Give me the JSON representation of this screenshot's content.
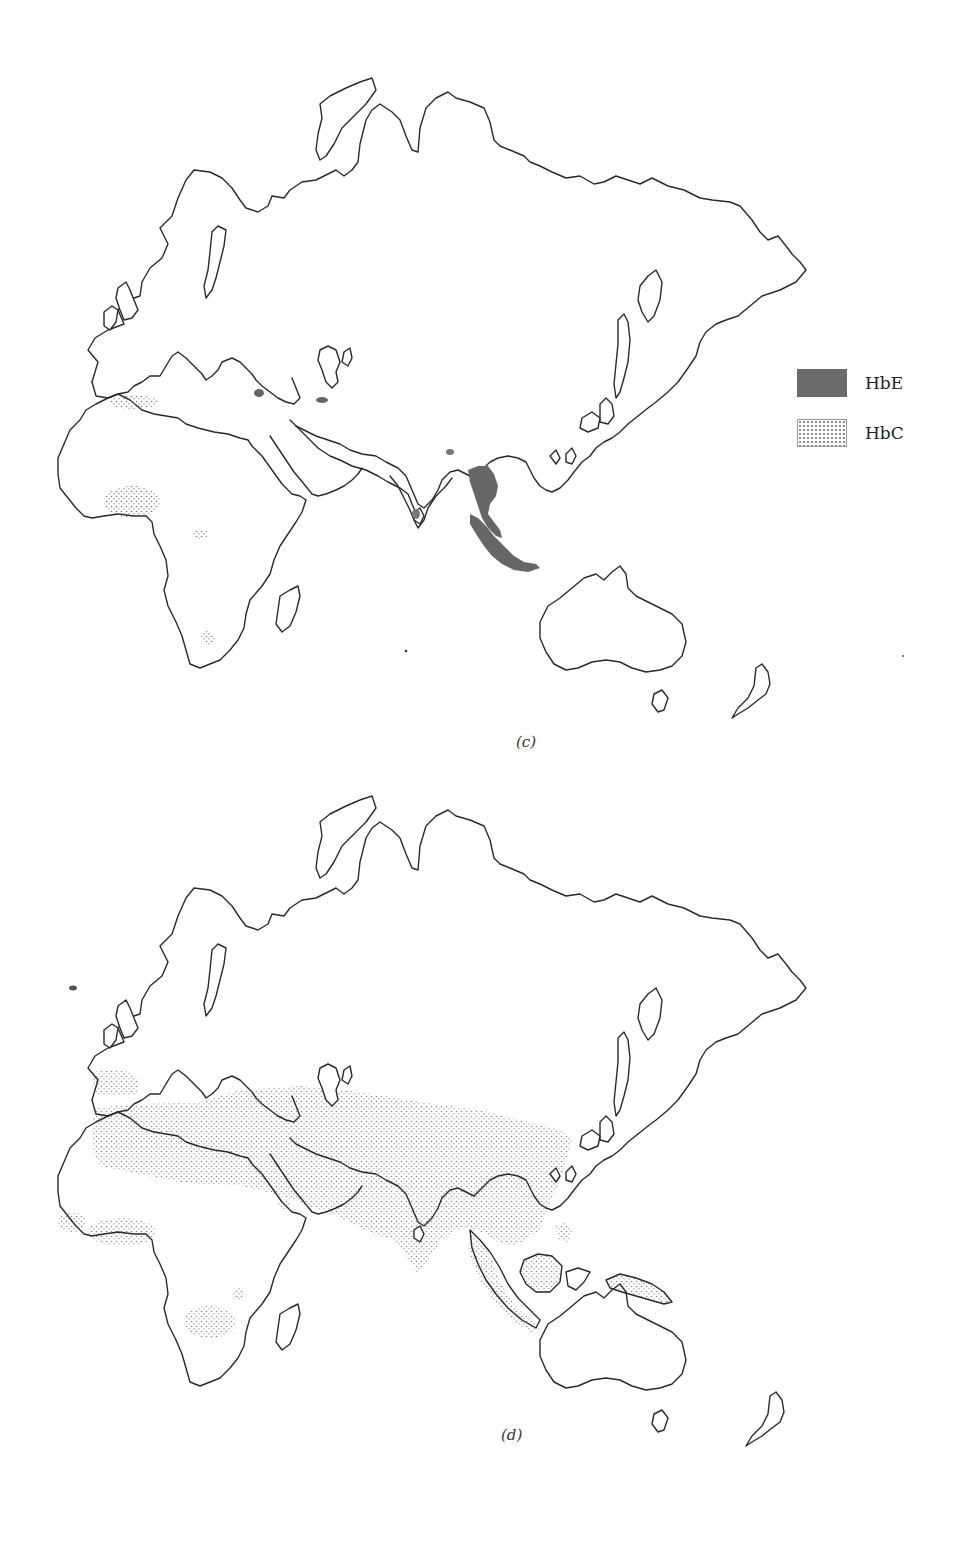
{
  "figure": {
    "panels": [
      {
        "id": "c",
        "caption": "(c)"
      },
      {
        "id": "d",
        "caption": "(d)"
      }
    ],
    "legend": {
      "items": [
        {
          "label": "HbE",
          "pattern": "solid",
          "color": "#6b6b6b"
        },
        {
          "label": "HbC",
          "pattern": "stipple",
          "color": "#8a8a8a"
        }
      ]
    }
  },
  "map_data": {
    "projection": "Eastern Hemisphere outline (Europe, Africa, Asia, Australia)",
    "panel_c_regions": {
      "HbE": [
        "Southeast Asia (Thailand/Myanmar)",
        "Malay Peninsula",
        "Sumatra",
        "Java",
        "Sri Lanka",
        "Bengal/Bangladesh area",
        "Eastern Mediterranean coast",
        "Caspian southern coast"
      ],
      "HbC": [
        "North Africa (Algeria/Tunisia coast)",
        "West Africa (Ghana/Burkina Faso)",
        "Central Africa",
        "Southern Africa"
      ]
    },
    "panel_d_regions": {
      "stippled": [
        "Iberia",
        "Italy/Balkans",
        "Mediterranean Africa to Middle East band",
        "Central Asia to China band",
        "India",
        "Indochina",
        "Malay Peninsula",
        "Sumatra",
        "Borneo",
        "Philippines",
        "New Guinea",
        "West Africa coast",
        "Central Africa",
        "South-central Africa",
        "Arabian Peninsula spot"
      ],
      "dark_spot": [
        "North Atlantic (Iceland area)"
      ]
    }
  }
}
